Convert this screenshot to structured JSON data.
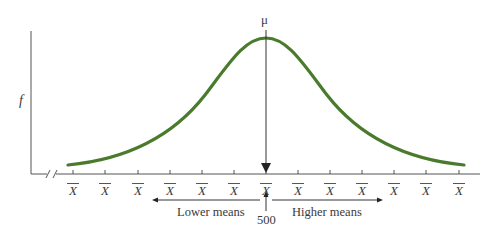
{
  "figure": {
    "type": "normal-distribution-of-sample-means",
    "y_axis_label": "f",
    "mean_label": "μ",
    "center_value": "500",
    "x_tick_label": "X̄",
    "x_tick_count": 13,
    "left_arrow_label": "Lower means",
    "right_arrow_label": "Higher means",
    "curve_color": "#4a7a2c",
    "axis_color": "#555555",
    "axis_break": "//"
  },
  "ticks": [
    "X",
    "X",
    "X",
    "X",
    "X",
    "X",
    "X",
    "X",
    "X",
    "X",
    "X",
    "X",
    "X"
  ]
}
